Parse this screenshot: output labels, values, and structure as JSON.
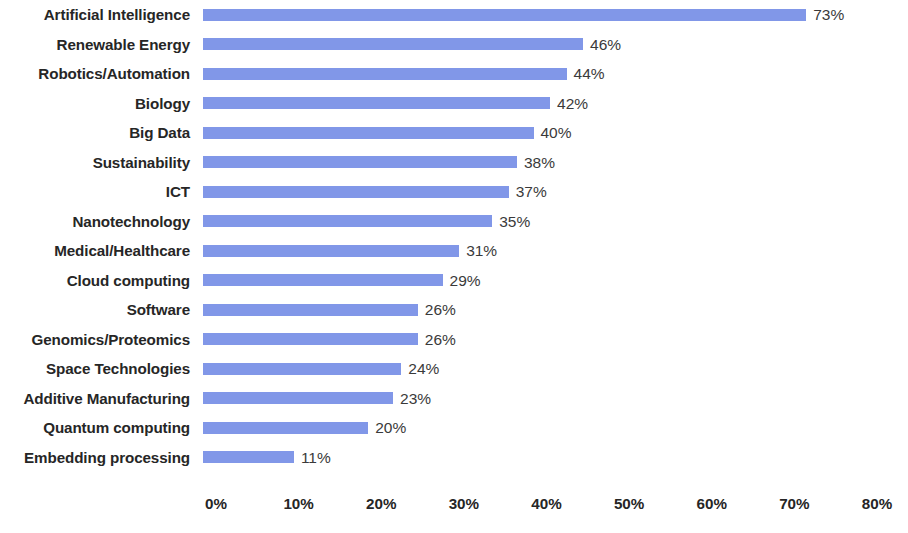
{
  "chart_data": {
    "type": "bar",
    "orientation": "horizontal",
    "title": "",
    "subtitle": "",
    "xlabel": "",
    "ylabel": "",
    "xlim": [
      0,
      80
    ],
    "grid": false,
    "legend": null,
    "bar_color": "#8197E8",
    "label_color": "#262626",
    "value_color": "#3a3a3a",
    "background": "#ffffff",
    "axis_ticks": [
      "0%",
      "10%",
      "20%",
      "30%",
      "40%",
      "50%",
      "60%",
      "70%",
      "80%"
    ],
    "axis_tick_values": [
      0,
      10,
      20,
      30,
      40,
      50,
      60,
      70,
      80
    ],
    "value_suffix": "%",
    "categories": [
      "Artificial Intelligence",
      "Renewable Energy",
      "Robotics/Automation",
      "Biology",
      "Big Data",
      "Sustainability",
      "ICT",
      "Nanotechnology",
      "Medical/Healthcare",
      "Cloud computing",
      "Software",
      "Genomics/Proteomics",
      "Space Technologies",
      "Additive Manufacturing",
      "Quantum computing",
      "Embedding processing"
    ],
    "values": [
      73,
      46,
      44,
      42,
      40,
      38,
      37,
      35,
      31,
      29,
      26,
      26,
      24,
      23,
      20,
      11
    ],
    "value_labels": [
      "73%",
      "46%",
      "44%",
      "42%",
      "40%",
      "38%",
      "37%",
      "35%",
      "31%",
      "29%",
      "26%",
      "26%",
      "24%",
      "23%",
      "20%",
      "11%"
    ]
  }
}
